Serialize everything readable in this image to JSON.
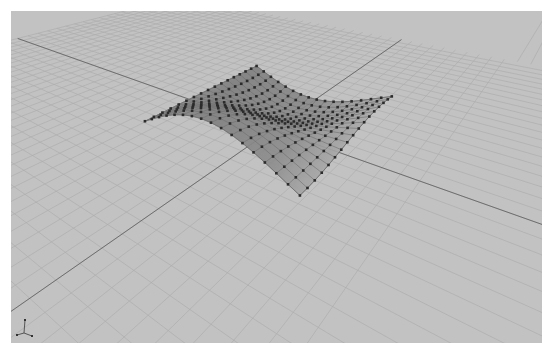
{
  "viewport": {
    "name": "Perspective",
    "background_color": "#c2c2c2",
    "grid_color": "#adadad",
    "axis_color": "#6e6e6e",
    "surface_fill": "#8f8f8f",
    "surface_edge": "#6a6a6a",
    "control_point_color": "#2b2b2b"
  },
  "scene": {
    "object_type": "NURBS surface",
    "control_points_visible": true,
    "grid_visible": true
  },
  "gizmo": {
    "axes": [
      "x",
      "y",
      "z"
    ]
  }
}
